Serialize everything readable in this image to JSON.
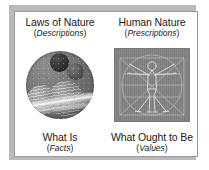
{
  "diagram": {
    "columns": [
      {
        "heading": "Laws of Nature",
        "subheading_open": "(",
        "subheading": "Descriptions",
        "subheading_close": ")",
        "figure_name": "planets-montage",
        "figure_alt": "Circular montage of ringed planets and moons",
        "footing": "What Is",
        "footnote_open": "(",
        "footnote": "Facts",
        "footnote_close": ")"
      },
      {
        "heading": "Human Nature",
        "subheading_open": "(",
        "subheading": "Prescriptions",
        "subheading_close": ")",
        "figure_name": "vitruvian-man",
        "figure_alt": "Leonardo da Vinci Vitruvian Man line drawing",
        "footing": "What Ought to Be",
        "footnote_open": "(",
        "footnote": "Values",
        "footnote_close": ")"
      }
    ],
    "colors": {
      "page_background": "#ffffff",
      "card_background": "#ffffff",
      "card_border": "#9a9a9a",
      "drop_shadow": "#b9b9b9",
      "text": "#1b1b1b",
      "vitruvian_panel": "#838383",
      "planet_dark": "#2a2a2a",
      "planet_light": "#d2d2d2"
    }
  }
}
